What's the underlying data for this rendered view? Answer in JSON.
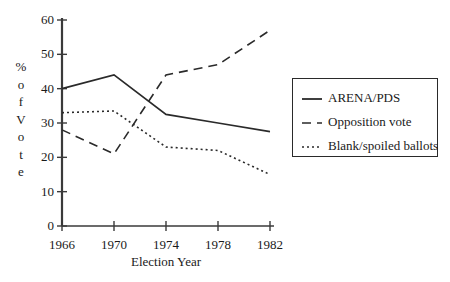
{
  "chart_data": {
    "type": "line",
    "title": "",
    "subtitle": "",
    "xlabel": "Election Year",
    "ylabel": "% of Vote",
    "ylabel_chars": [
      "%",
      "o",
      "f",
      "V",
      "o",
      "t",
      "e"
    ],
    "categories": [
      "1966",
      "1970",
      "1974",
      "1978",
      "1982"
    ],
    "x": [
      1966,
      1970,
      1974,
      1978,
      1982
    ],
    "xlim": [
      1966,
      1982
    ],
    "ylim": [
      0,
      60
    ],
    "ytick_labels": [
      "0",
      "10",
      "20",
      "30",
      "40",
      "50",
      "60"
    ],
    "yticks": [
      0,
      10,
      20,
      30,
      40,
      50,
      60
    ],
    "xtick_labels": [
      "1966",
      "1970",
      "1974",
      "1978",
      "1982"
    ],
    "grid": false,
    "legend_position": "right",
    "series": [
      {
        "name": "ARENA/PDS",
        "style": "solid",
        "color": "#2a2a2a",
        "values": [
          40,
          44,
          32.5,
          30,
          27.5
        ]
      },
      {
        "name": "Opposition vote",
        "style": "dashed",
        "color": "#2a2a2a",
        "values": [
          28,
          21,
          44,
          47,
          57
        ]
      },
      {
        "name": "Blank/spoiled ballots",
        "style": "dotted",
        "color": "#2a2a2a",
        "values": [
          33,
          33.5,
          23,
          22,
          15
        ]
      }
    ]
  },
  "legend": {
    "items": [
      {
        "label": "ARENA/PDS",
        "style": "solid"
      },
      {
        "label": "Opposition vote",
        "style": "dashed"
      },
      {
        "label": "Blank/spoiled ballots",
        "style": "dotted"
      }
    ]
  },
  "axis": {
    "color": "#3a3a3a"
  }
}
